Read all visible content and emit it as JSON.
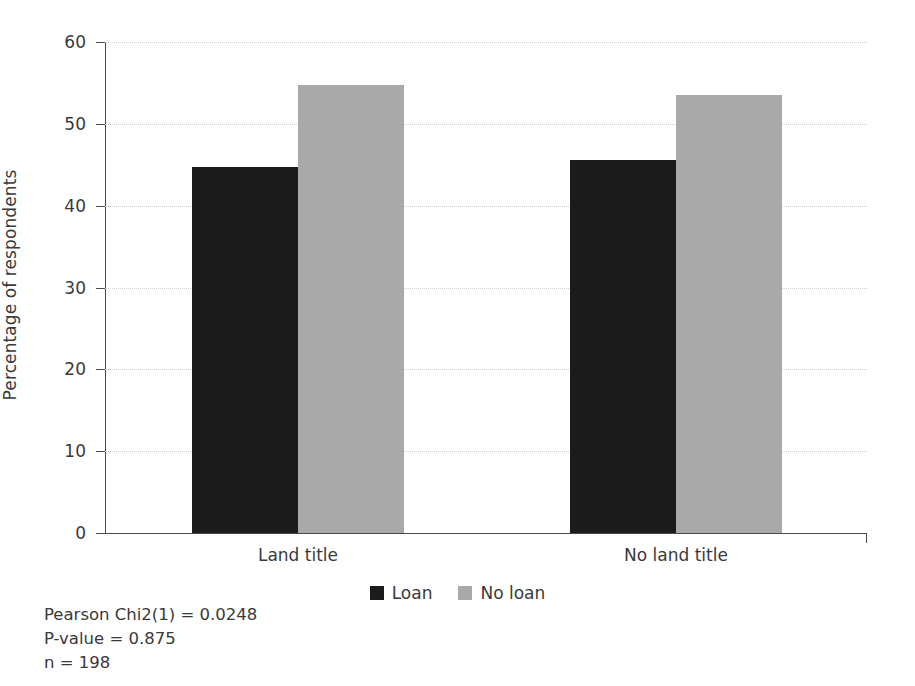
{
  "chart_data": {
    "type": "bar",
    "title": "",
    "xlabel": "",
    "ylabel": "Percentage of respondents",
    "ylim": [
      0,
      60
    ],
    "yticks": [
      0,
      10,
      20,
      30,
      40,
      50,
      60
    ],
    "ytick_labels": [
      "0",
      "10",
      "20",
      "30",
      "40",
      "50",
      "60"
    ],
    "grid": true,
    "grid_axis": "y",
    "legend_position": "bottom-center",
    "categories": [
      "Land title",
      "No land title"
    ],
    "series": [
      {
        "name": "Loan",
        "color": "#1b1b1b",
        "values": [
          44.7,
          45.6
        ]
      },
      {
        "name": "No loan",
        "color": "#a9a9a9",
        "values": [
          54.8,
          53.5
        ]
      }
    ],
    "annotations": [
      "Pearson Chi2(1) = 0.0248",
      "P-value = 0.875",
      "n = 198"
    ]
  },
  "colors": {
    "loan": "#1b1b1b",
    "no_loan": "#a9a9a9",
    "axis": "#4a4a4a",
    "grid": "#cfcfcf",
    "text": "#3a3a3a",
    "background": "#ffffff"
  }
}
